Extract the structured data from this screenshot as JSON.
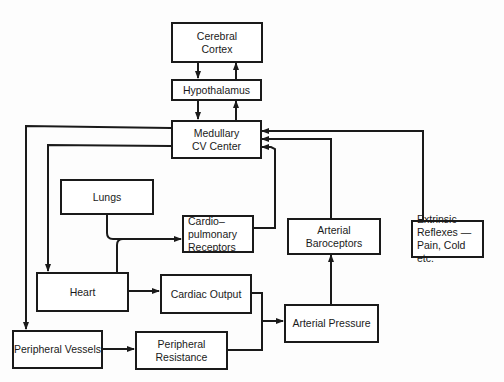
{
  "diagram": {
    "type": "flow",
    "title": "",
    "nodes": {
      "cerebral_cortex": "Cerebral\nCortex",
      "hypothalamus": "Hypothalamus",
      "medullary": "Medullary\nCV Center",
      "lungs": "Lungs",
      "cardiopulmonary": "Cardio–\n  pulmonary\n        Receptors",
      "arterial_baroceptors": "Arterial\nBaroceptors",
      "extrinsic_reflexes": "Extrinsic\nReflexes —\n  Pain, Cold etc.",
      "heart": "Heart",
      "cardiac_output": "Cardiac Output",
      "arterial_pressure": "Arterial Pressure",
      "peripheral_vessels": "Peripheral Vessels",
      "peripheral_resistance": "Peripheral\nResistance"
    },
    "edges": [
      [
        "Cerebral Cortex",
        "Hypothalamus"
      ],
      [
        "Hypothalamus",
        "Cerebral Cortex"
      ],
      [
        "Hypothalamus",
        "Medullary CV Center"
      ],
      [
        "Medullary CV Center",
        "Hypothalamus"
      ],
      [
        "Medullary CV Center",
        "Heart"
      ],
      [
        "Medullary CV Center",
        "Peripheral Vessels"
      ],
      [
        "Lungs",
        "Cardiopulmonary Receptors"
      ],
      [
        "Heart",
        "Cardiopulmonary Receptors"
      ],
      [
        "Cardiopulmonary Receptors",
        "Medullary CV Center"
      ],
      [
        "Arterial Baroceptors",
        "Medullary CV Center"
      ],
      [
        "Extrinsic Reflexes",
        "Medullary CV Center"
      ],
      [
        "Heart",
        "Cardiac Output"
      ],
      [
        "Peripheral Vessels",
        "Peripheral Resistance"
      ],
      [
        "Cardiac Output",
        "Arterial Pressure"
      ],
      [
        "Peripheral Resistance",
        "Arterial Pressure"
      ],
      [
        "Arterial Pressure",
        "Arterial Baroceptors"
      ]
    ]
  }
}
